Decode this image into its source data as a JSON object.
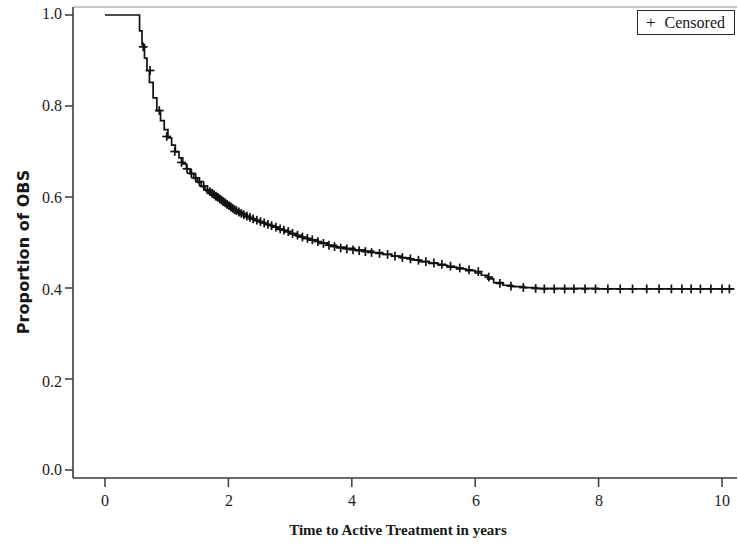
{
  "chart_data": {
    "type": "line",
    "title": "",
    "subtitle": "",
    "xlabel": "Time to Active Treatment in years",
    "ylabel": "Proportion of OBS",
    "xlim": [
      0,
      10.2
    ],
    "ylim": [
      0.0,
      1.0
    ],
    "xticks": [
      0,
      2,
      4,
      6,
      8,
      10
    ],
    "xticklabels": [
      "0",
      "2",
      "4",
      "6",
      "8",
      "10"
    ],
    "yticks": [
      0.0,
      0.2,
      0.4,
      0.6,
      0.8,
      1.0
    ],
    "yticklabels": [
      "0.0",
      "0.2",
      "0.4",
      "0.6",
      "0.8",
      "1.0"
    ],
    "grid": false,
    "legend_position": "upper right",
    "line_color": "#111111",
    "plot_style": "kaplan-meier step function",
    "series": [
      {
        "name": "OBS",
        "step": "post",
        "x": [
          0,
          0.52,
          0.56,
          0.6,
          0.64,
          0.68,
          0.72,
          0.78,
          0.84,
          0.9,
          0.96,
          1.02,
          1.08,
          1.14,
          1.2,
          1.26,
          1.32,
          1.38,
          1.44,
          1.5,
          1.56,
          1.62,
          1.68,
          1.74,
          1.8,
          1.86,
          1.92,
          1.98,
          2.04,
          2.1,
          2.18,
          2.26,
          2.34,
          2.42,
          2.5,
          2.6,
          2.7,
          2.8,
          2.9,
          3.0,
          3.1,
          3.2,
          3.3,
          3.45,
          3.6,
          3.75,
          3.9,
          4.05,
          4.2,
          4.35,
          4.5,
          4.65,
          4.8,
          4.95,
          5.1,
          5.25,
          5.4,
          5.55,
          5.7,
          5.85,
          6.0,
          6.1,
          6.2,
          6.3,
          6.45,
          6.6,
          6.8,
          7.0,
          7.3,
          7.6,
          8.0,
          8.5,
          9.0,
          9.5,
          10.0,
          10.2
        ],
        "y": [
          1.0,
          1.0,
          0.965,
          0.935,
          0.905,
          0.878,
          0.852,
          0.818,
          0.79,
          0.768,
          0.748,
          0.73,
          0.714,
          0.699,
          0.686,
          0.673,
          0.662,
          0.651,
          0.641,
          0.632,
          0.623,
          0.615,
          0.608,
          0.601,
          0.594,
          0.588,
          0.582,
          0.577,
          0.572,
          0.567,
          0.562,
          0.557,
          0.552,
          0.548,
          0.544,
          0.539,
          0.534,
          0.529,
          0.524,
          0.519,
          0.514,
          0.509,
          0.505,
          0.499,
          0.494,
          0.49,
          0.487,
          0.484,
          0.481,
          0.478,
          0.474,
          0.47,
          0.466,
          0.462,
          0.458,
          0.454,
          0.45,
          0.446,
          0.442,
          0.438,
          0.433,
          0.428,
          0.42,
          0.412,
          0.406,
          0.403,
          0.401,
          0.399,
          0.399,
          0.399,
          0.398,
          0.398,
          0.398,
          0.398,
          0.398,
          0.398
        ]
      }
    ],
    "censored_marks": {
      "label": "Censored",
      "symbol": "+",
      "x": [
        0.62,
        0.73,
        0.88,
        1.0,
        1.13,
        1.24,
        1.33,
        1.4,
        1.47,
        1.53,
        1.6,
        1.66,
        1.7,
        1.74,
        1.77,
        1.8,
        1.83,
        1.86,
        1.89,
        1.92,
        1.95,
        1.98,
        2.01,
        2.04,
        2.07,
        2.1,
        2.13,
        2.17,
        2.21,
        2.25,
        2.3,
        2.35,
        2.4,
        2.46,
        2.52,
        2.58,
        2.64,
        2.7,
        2.77,
        2.84,
        2.9,
        2.97,
        3.04,
        3.12,
        3.2,
        3.28,
        3.36,
        3.45,
        3.54,
        3.63,
        3.72,
        3.82,
        3.92,
        4.02,
        4.12,
        4.22,
        4.32,
        4.45,
        4.58,
        4.7,
        4.82,
        4.95,
        5.08,
        5.2,
        5.33,
        5.46,
        5.6,
        5.75,
        5.9,
        6.05,
        6.22,
        6.4,
        6.58,
        6.78,
        6.98,
        7.12,
        7.28,
        7.45,
        7.6,
        7.78,
        7.95,
        8.15,
        8.35,
        8.55,
        8.78,
        8.98,
        9.18,
        9.35,
        9.5,
        9.65,
        9.82,
        10.0,
        10.12
      ],
      "y": [
        0.93,
        0.878,
        0.79,
        0.733,
        0.7,
        0.676,
        0.662,
        0.652,
        0.642,
        0.634,
        0.624,
        0.616,
        0.612,
        0.608,
        0.605,
        0.602,
        0.599,
        0.596,
        0.593,
        0.59,
        0.587,
        0.584,
        0.581,
        0.578,
        0.575,
        0.572,
        0.57,
        0.567,
        0.564,
        0.561,
        0.558,
        0.555,
        0.552,
        0.549,
        0.546,
        0.543,
        0.54,
        0.537,
        0.534,
        0.53,
        0.527,
        0.524,
        0.52,
        0.516,
        0.512,
        0.509,
        0.506,
        0.502,
        0.498,
        0.494,
        0.491,
        0.488,
        0.486,
        0.484,
        0.482,
        0.48,
        0.478,
        0.476,
        0.474,
        0.47,
        0.467,
        0.464,
        0.461,
        0.458,
        0.455,
        0.452,
        0.448,
        0.444,
        0.44,
        0.436,
        0.424,
        0.41,
        0.404,
        0.401,
        0.399,
        0.398,
        0.398,
        0.398,
        0.398,
        0.398,
        0.398,
        0.398,
        0.398,
        0.398,
        0.398,
        0.398,
        0.398,
        0.398,
        0.398,
        0.398,
        0.398,
        0.398,
        0.398
      ]
    }
  },
  "axes": {
    "y_title": "Proportion of OBS",
    "x_title": "Time to Active Treatment in years",
    "y_labels": [
      "1.0",
      "0.8",
      "0.6",
      "0.4",
      "0.2",
      "0.0"
    ],
    "x_labels": [
      "0",
      "2",
      "4",
      "6",
      "8",
      "10"
    ]
  },
  "legend": {
    "symbol": "+",
    "label": "Censored"
  }
}
